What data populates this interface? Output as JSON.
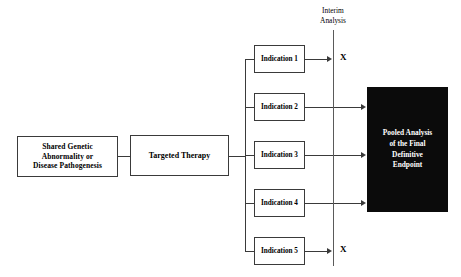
{
  "diagram": {
    "background_color": "#ffffff",
    "line_color": "#3a3a3a",
    "pooled_box_color": "#0b0b0b",
    "pooled_text_color": "#ffffff"
  },
  "nodes": {
    "origin": {
      "label": "Shared Genetic Abnormality or Disease Pathogenesis",
      "lines": [
        "Shared Genetic",
        "Abnormality or",
        "Disease Pathogenesis"
      ]
    },
    "therapy": {
      "label": "Targeted Therapy",
      "lines": [
        "Targeted Therapy"
      ]
    },
    "pooled": {
      "label": "Pooled Analysis of the Final Definitive Endpoint",
      "lines": [
        "Pooled Analysis",
        "of the Final",
        "Definitive",
        "Endpoint"
      ]
    }
  },
  "indications": [
    {
      "label": "Indication 1",
      "outcome": "X",
      "to_pooled": false
    },
    {
      "label": "Indication 2",
      "outcome": "",
      "to_pooled": true
    },
    {
      "label": "Indication 3",
      "outcome": "",
      "to_pooled": true
    },
    {
      "label": "Indication 4",
      "outcome": "",
      "to_pooled": true
    },
    {
      "label": "Indication 5",
      "outcome": "X",
      "to_pooled": false
    }
  ],
  "interim": {
    "label": "Interim Analysis",
    "lines": [
      "Interim",
      "Analysis"
    ],
    "stop_marks": [
      "X",
      "X"
    ]
  }
}
